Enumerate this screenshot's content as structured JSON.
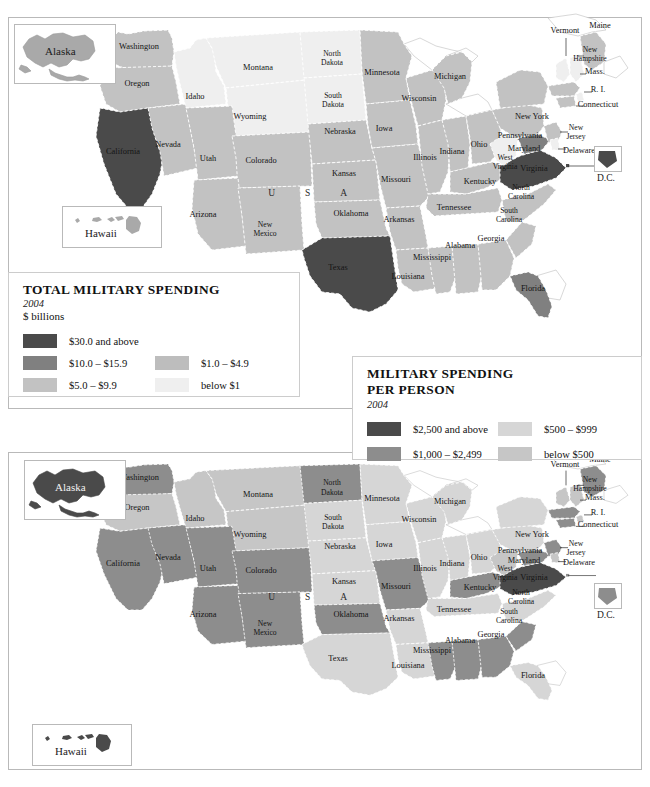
{
  "page": {
    "background": "#ffffff"
  },
  "palette": {
    "darkest": "#4a4a4a",
    "dark": "#808080",
    "mid": "#b0b0b0",
    "light": "#c9c9c9",
    "lightest": "#ececec",
    "water": "#ffffff",
    "border": "#b9b9b9",
    "state_line": "#ffffff",
    "text": "#141414"
  },
  "legends": [
    {
      "id": "total-military-spending",
      "title_lines": [
        "TOTAL MILITARY SPENDING"
      ],
      "year": "2004",
      "unit": "$ billions",
      "items_left": [
        {
          "label": "$30.0 and above",
          "color": "#4a4a4a"
        },
        {
          "label": "$10.0 – $15.9",
          "color": "#808080"
        },
        {
          "label": "$5.0 – $9.9",
          "color": "#c2c2c2"
        }
      ],
      "items_right": [
        {
          "label": "",
          "color": ""
        },
        {
          "label": "$1.0 – $4.9",
          "color": "#bdbdbd"
        },
        {
          "label": "below $1",
          "color": "#efefef"
        }
      ]
    },
    {
      "id": "military-spending-per-person",
      "title_lines": [
        "MILITARY SPENDING",
        "PER PERSON"
      ],
      "year": "2004",
      "unit": "",
      "items_left": [
        {
          "label": "$2,500 and above",
          "color": "#4a4a4a"
        },
        {
          "label": "$1,000 – $2,499",
          "color": "#8d8d8d"
        }
      ],
      "items_right": [
        {
          "label": "$500 – $999",
          "color": "#d6d6d6"
        },
        {
          "label": "below $500",
          "color": "#c6c6c6"
        }
      ]
    }
  ],
  "insets": {
    "alaska_label": "Alaska",
    "hawaii_label": "Hawaii",
    "dc_label": "D.C."
  },
  "usa_letters": [
    "U",
    "S",
    "A"
  ],
  "state_labels": [
    {
      "name": "Washington",
      "x": 139,
      "y": 41,
      "lines": [
        "Washington"
      ]
    },
    {
      "name": "Oregon",
      "x": 137,
      "y": 78,
      "lines": [
        "Oregon"
      ]
    },
    {
      "name": "California",
      "x": 123,
      "y": 146,
      "lines": [
        "California"
      ]
    },
    {
      "name": "Nevada",
      "x": 168,
      "y": 139,
      "lines": [
        "Nevada"
      ]
    },
    {
      "name": "Idaho",
      "x": 195,
      "y": 91,
      "lines": [
        "Idaho"
      ]
    },
    {
      "name": "Montana",
      "x": 258,
      "y": 62,
      "lines": [
        "Montana"
      ]
    },
    {
      "name": "Wyoming",
      "x": 250,
      "y": 111,
      "lines": [
        "Wyoming"
      ]
    },
    {
      "name": "Utah",
      "x": 208,
      "y": 153,
      "lines": [
        "Utah"
      ]
    },
    {
      "name": "Colorado",
      "x": 261,
      "y": 155,
      "lines": [
        "Colorado"
      ]
    },
    {
      "name": "Arizona",
      "x": 203,
      "y": 209,
      "lines": [
        "Arizona"
      ]
    },
    {
      "name": "New Mexico",
      "x": 265,
      "y": 219,
      "lines": [
        "New",
        "Mexico"
      ]
    },
    {
      "name": "North Dakota",
      "x": 332,
      "y": 48,
      "lines": [
        "North",
        "Dakota"
      ]
    },
    {
      "name": "South Dakota",
      "x": 333,
      "y": 90,
      "lines": [
        "South",
        "Dakota"
      ]
    },
    {
      "name": "Nebraska",
      "x": 340,
      "y": 126,
      "lines": [
        "Nebraska"
      ]
    },
    {
      "name": "Kansas",
      "x": 344,
      "y": 168,
      "lines": [
        "Kansas"
      ]
    },
    {
      "name": "Oklahoma",
      "x": 351,
      "y": 208,
      "lines": [
        "Oklahoma"
      ]
    },
    {
      "name": "Texas",
      "x": 338,
      "y": 262,
      "lines": [
        "Texas"
      ]
    },
    {
      "name": "Minnesota",
      "x": 382,
      "y": 67,
      "lines": [
        "Minnesota"
      ]
    },
    {
      "name": "Iowa",
      "x": 384,
      "y": 123,
      "lines": [
        "Iowa"
      ]
    },
    {
      "name": "Missouri",
      "x": 396,
      "y": 174,
      "lines": [
        "Missouri"
      ]
    },
    {
      "name": "Arkansas",
      "x": 399,
      "y": 214,
      "lines": [
        "Arkansas"
      ]
    },
    {
      "name": "Louisiana",
      "x": 408,
      "y": 271,
      "lines": [
        "Louisiana"
      ]
    },
    {
      "name": "Wisconsin",
      "x": 419,
      "y": 93,
      "lines": [
        "Wisconsin"
      ]
    },
    {
      "name": "Illinois",
      "x": 425,
      "y": 152,
      "lines": [
        "Illinois"
      ]
    },
    {
      "name": "Mississippi",
      "x": 432,
      "y": 252,
      "lines": [
        "Mississippi"
      ]
    },
    {
      "name": "Michigan",
      "x": 450,
      "y": 71,
      "lines": [
        "Michigan"
      ]
    },
    {
      "name": "Indiana",
      "x": 452,
      "y": 146,
      "lines": [
        "Indiana"
      ]
    },
    {
      "name": "Tennessee",
      "x": 454,
      "y": 202,
      "lines": [
        "Tennessee"
      ]
    },
    {
      "name": "Alabama",
      "x": 460,
      "y": 240,
      "lines": [
        "Alabama"
      ]
    },
    {
      "name": "Ohio",
      "x": 479,
      "y": 139,
      "lines": [
        "Ohio"
      ]
    },
    {
      "name": "Kentucky",
      "x": 480,
      "y": 176,
      "lines": [
        "Kentucky"
      ]
    },
    {
      "name": "Georgia",
      "x": 491,
      "y": 233,
      "lines": [
        "Georgia"
      ]
    },
    {
      "name": "Florida",
      "x": 533,
      "y": 283,
      "lines": [
        "Florida"
      ]
    },
    {
      "name": "South Carolina",
      "x": 509,
      "y": 205,
      "lines": [
        "South",
        "Carolina"
      ]
    },
    {
      "name": "North Carolina",
      "x": 521,
      "y": 182,
      "lines": [
        "North",
        "Carolina"
      ]
    },
    {
      "name": "West Virginia",
      "x": 505,
      "y": 152,
      "lines": [
        "West",
        "Virginia"
      ]
    },
    {
      "name": "Virginia",
      "x": 534,
      "y": 163,
      "lines": [
        "Virginia"
      ]
    },
    {
      "name": "Maryland",
      "x": 524,
      "y": 143,
      "lines": [
        "Maryland"
      ]
    },
    {
      "name": "Pennsylvania",
      "x": 520,
      "y": 130,
      "lines": [
        "Pennsylvania"
      ]
    },
    {
      "name": "New York",
      "x": 532,
      "y": 111,
      "lines": [
        "New York"
      ]
    },
    {
      "name": "Vermont",
      "x": 565,
      "y": 25,
      "lines": [
        "Vermont"
      ]
    },
    {
      "name": "Maine",
      "x": 600,
      "y": 20,
      "lines": [
        "Maine"
      ]
    },
    {
      "name": "New Hampshire",
      "x": 590,
      "y": 44,
      "lines": [
        "New",
        "Hampshire"
      ]
    },
    {
      "name": "Massachusetts",
      "x": 595,
      "y": 66,
      "lines": [
        "Mass."
      ]
    },
    {
      "name": "Rhode Island",
      "x": 598,
      "y": 84,
      "lines": [
        "R. I."
      ]
    },
    {
      "name": "Connecticut",
      "x": 598,
      "y": 99,
      "lines": [
        "Connecticut"
      ]
    },
    {
      "name": "New Jersey",
      "x": 576,
      "y": 122,
      "lines": [
        "New",
        "Jersey"
      ]
    },
    {
      "name": "Delaware",
      "x": 579,
      "y": 145,
      "lines": [
        "Delaware"
      ]
    }
  ],
  "choropleth_total": {
    "type": "choropleth",
    "title": "TOTAL MILITARY SPENDING",
    "year": "2004",
    "unit": "$ billions",
    "classes": [
      {
        "label": "$30.0 and above",
        "color": "#4a4a4a"
      },
      {
        "label": "$10.0 – $15.9",
        "color": "#808080"
      },
      {
        "label": "$5.0 – $9.9",
        "color": "#c2c2c2"
      },
      {
        "label": "$1.0 – $4.9",
        "color": "#bdbdbd"
      },
      {
        "label": "below $1",
        "color": "#efefef"
      }
    ],
    "values": {
      "CA": "$30.0 and above",
      "TX": "$30.0 and above",
      "VA": "$30.0 and above",
      "FL": "$10.0 – $15.9",
      "MD": "$10.0 – $15.9",
      "WA": "$5.0 – $9.9",
      "OR": "$5.0 – $9.9",
      "NV": "$5.0 – $9.9",
      "AZ": "$5.0 – $9.9",
      "UT": "$5.0 – $9.9",
      "CO": "$5.0 – $9.9",
      "NM": "$5.0 – $9.9",
      "KS": "$5.0 – $9.9",
      "OK": "$5.0 – $9.9",
      "NE": "$5.0 – $9.9",
      "MN": "$5.0 – $9.9",
      "IA": "$5.0 – $9.9",
      "MO": "$5.0 – $9.9",
      "AR": "$5.0 – $9.9",
      "LA": "$5.0 – $9.9",
      "WI": "$5.0 – $9.9",
      "IL": "$5.0 – $9.9",
      "MI": "$5.0 – $9.9",
      "IN": "$5.0 – $9.9",
      "OH": "$5.0 – $9.9",
      "KY": "$5.0 – $9.9",
      "TN": "$5.0 – $9.9",
      "MS": "$5.0 – $9.9",
      "AL": "$5.0 – $9.9",
      "GA": "$5.0 – $9.9",
      "SC": "$5.0 – $9.9",
      "NC": "$5.0 – $9.9",
      "PA": "$5.0 – $9.9",
      "NY": "$5.0 – $9.9",
      "NJ": "$5.0 – $9.9",
      "CT": "$5.0 – $9.9",
      "MA": "$5.0 – $9.9",
      "ME": "$5.0 – $9.9",
      "AK": "$5.0 – $9.9",
      "HI": "$5.0 – $9.9",
      "MT": "below $1",
      "ID": "below $1",
      "WY": "below $1",
      "ND": "below $1",
      "SD": "below $1",
      "WV": "below $1",
      "VT": "below $1",
      "NH": "below $1",
      "RI": "below $1",
      "DE": "below $1"
    }
  },
  "choropleth_per_person": {
    "type": "choropleth",
    "title": "MILITARY SPENDING PER PERSON",
    "year": "2004",
    "unit": "",
    "classes": [
      {
        "label": "$2,500 and above",
        "color": "#4a4a4a"
      },
      {
        "label": "$1,000 – $2,499",
        "color": "#8d8d8d"
      },
      {
        "label": "$500 – $999",
        "color": "#d6d6d6"
      },
      {
        "label": "below $500",
        "color": "#c6c6c6"
      }
    ],
    "values": {
      "VA": "$2,500 and above",
      "AK": "$2,500 and above",
      "HI": "$2,500 and above",
      "MD": "$1,000 – $2,499",
      "CT": "$1,000 – $2,499",
      "MA": "$1,000 – $2,499",
      "ME": "$1,000 – $2,499",
      "ND": "$1,000 – $2,499",
      "WA": "$1,000 – $2,499",
      "CA": "$1,000 – $2,499",
      "UT": "$1,000 – $2,499",
      "CO": "$1,000 – $2,499",
      "MO": "$1,000 – $2,499",
      "KY": "$1,000 – $2,499",
      "AL": "$1,000 – $2,499",
      "MS": "$1,000 – $2,499",
      "GA": "$1,000 – $2,499",
      "SC": "$1,000 – $2,499",
      "OK": "$1,000 – $2,499",
      "AZ": "$1,000 – $2,499",
      "NM": "$1,000 – $2,499",
      "NV": "$1,000 – $2,499",
      "NJ": "$1,000 – $2,499",
      "PA": "$500 – $999",
      "NY": "$500 – $999",
      "OH": "$500 – $999",
      "IN": "$500 – $999",
      "IL": "$500 – $999",
      "TX": "$500 – $999",
      "FL": "$500 – $999",
      "NC": "$500 – $999",
      "TN": "$500 – $999",
      "LA": "$500 – $999",
      "AR": "$500 – $999",
      "KS": "$500 – $999",
      "NE": "$500 – $999",
      "IA": "$500 – $999",
      "MN": "$500 – $999",
      "WI": "$500 – $999",
      "MI": "$500 – $999",
      "SD": "$500 – $999",
      "MT": "below $500",
      "ID": "below $500",
      "WY": "below $500",
      "OR": "below $500",
      "WV": "below $500",
      "VT": "below $500",
      "NH": "below $500",
      "RI": "below $500",
      "DE": "below $500"
    }
  }
}
